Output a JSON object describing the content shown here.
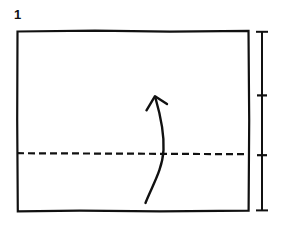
{
  "figure": {
    "kind": "origami-fold-diagram",
    "step_number": "1",
    "background_color": "#ffffff",
    "ink_color": "#111111"
  },
  "paper": {
    "label": "square-paper-outline",
    "shape": "rectangle",
    "x": 17,
    "y": 31,
    "width": 232,
    "height": 180,
    "stroke_width": 2.2,
    "stroke_color": "#111111",
    "fill": "none"
  },
  "crease": {
    "label": "horizontal-valley-fold-line",
    "style": "dashed",
    "y": 153,
    "x_start": 17,
    "x_end": 249,
    "dash_length": 7,
    "dash_gap": 4,
    "stroke_width": 2.2,
    "stroke_color": "#111111"
  },
  "arrow": {
    "label": "fold-up-arrow",
    "direction": "up",
    "tail_x": 145,
    "tail_y": 203,
    "tip_x": 155,
    "tip_y": 96,
    "stroke_width": 2.4,
    "stroke_color": "#111111",
    "head_style": "open-v"
  },
  "measure": {
    "label": "height-measurement-bar",
    "x": 262,
    "y_top": 31,
    "y_bottom": 211,
    "cap_half_width": 6,
    "stroke_width": 2.0,
    "stroke_color": "#111111",
    "ticks": [
      {
        "label": "upper-tick",
        "y": 95,
        "half_width": 5
      },
      {
        "label": "lower-tick",
        "y": 155,
        "half_width": 5
      }
    ]
  }
}
